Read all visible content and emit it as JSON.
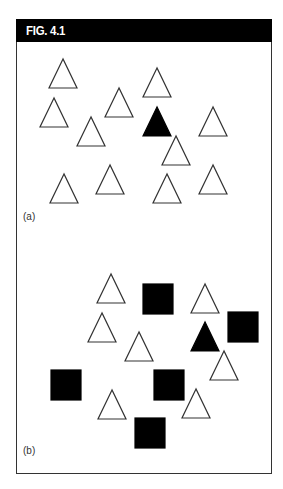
{
  "figure": {
    "title": "FIG. 4.1",
    "colors": {
      "header_bg": "#000000",
      "header_text": "#ffffff",
      "outline": "#333333",
      "filled": "#000000",
      "background": "#ffffff"
    }
  },
  "panels": [
    {
      "label": "(a)",
      "description": "Visual search display: 12 outlined triangles with one filled (black) triangle target",
      "shapes": [
        {
          "type": "triangle",
          "fill": "outline",
          "apex": [
            63,
            59
          ]
        },
        {
          "type": "triangle",
          "fill": "outline",
          "apex": [
            157,
            68
          ]
        },
        {
          "type": "triangle",
          "fill": "outline",
          "apex": [
            119,
            88
          ]
        },
        {
          "type": "triangle",
          "fill": "outline",
          "apex": [
            54,
            98
          ]
        },
        {
          "type": "triangle",
          "fill": "filled",
          "apex": [
            157,
            107
          ]
        },
        {
          "type": "triangle",
          "fill": "outline",
          "apex": [
            213,
            107
          ]
        },
        {
          "type": "triangle",
          "fill": "outline",
          "apex": [
            91,
            117
          ]
        },
        {
          "type": "triangle",
          "fill": "outline",
          "apex": [
            176,
            136
          ]
        },
        {
          "type": "triangle",
          "fill": "outline",
          "apex": [
            110,
            165
          ]
        },
        {
          "type": "triangle",
          "fill": "outline",
          "apex": [
            213,
            165
          ]
        },
        {
          "type": "triangle",
          "fill": "outline",
          "apex": [
            64,
            174
          ]
        },
        {
          "type": "triangle",
          "fill": "outline",
          "apex": [
            167,
            174
          ]
        }
      ]
    },
    {
      "label": "(b)",
      "description": "Conjunction search display: outlined triangles and filled squares with one filled triangle target",
      "shapes": [
        {
          "type": "triangle",
          "fill": "outline",
          "apex": [
            111,
            274
          ]
        },
        {
          "type": "square",
          "fill": "filled",
          "x": 143,
          "y": 284,
          "size": 30
        },
        {
          "type": "triangle",
          "fill": "outline",
          "apex": [
            205,
            284
          ]
        },
        {
          "type": "square",
          "fill": "filled",
          "x": 228,
          "y": 312,
          "size": 30
        },
        {
          "type": "triangle",
          "fill": "outline",
          "apex": [
            102,
            313
          ]
        },
        {
          "type": "triangle",
          "fill": "filled",
          "apex": [
            205,
            322
          ]
        },
        {
          "type": "triangle",
          "fill": "outline",
          "apex": [
            139,
            332
          ]
        },
        {
          "type": "triangle",
          "fill": "outline",
          "apex": [
            224,
            351
          ]
        },
        {
          "type": "square",
          "fill": "filled",
          "x": 51,
          "y": 370,
          "size": 30
        },
        {
          "type": "square",
          "fill": "filled",
          "x": 154,
          "y": 370,
          "size": 30
        },
        {
          "type": "triangle",
          "fill": "outline",
          "apex": [
            112,
            390
          ]
        },
        {
          "type": "triangle",
          "fill": "outline",
          "apex": [
            196,
            389
          ]
        },
        {
          "type": "square",
          "fill": "filled",
          "x": 135,
          "y": 418,
          "size": 30
        }
      ]
    }
  ]
}
